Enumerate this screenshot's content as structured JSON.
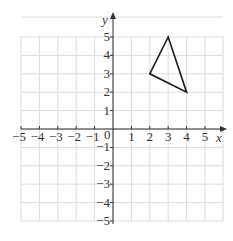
{
  "diagram": {
    "type": "coordinate-grid",
    "x_axis": {
      "label": "x",
      "min": -5,
      "max": 5,
      "ticks": [
        "−5",
        "−4",
        "−3",
        "−2",
        "−1",
        "1",
        "2",
        "3",
        "4",
        "5"
      ]
    },
    "y_axis": {
      "label": "y",
      "min": -5,
      "max": 5,
      "ticks": [
        "5",
        "4",
        "3",
        "2",
        "1",
        "−1",
        "−2",
        "−3",
        "−4",
        "−5"
      ]
    },
    "origin_label": "0",
    "shape": {
      "name": "triangle",
      "vertices": [
        [
          2,
          3
        ],
        [
          3,
          5
        ],
        [
          4,
          2
        ]
      ]
    },
    "colors": {
      "grid": "#dcdcdc",
      "axis": "#333333",
      "shape": "#1a1a1a"
    }
  }
}
